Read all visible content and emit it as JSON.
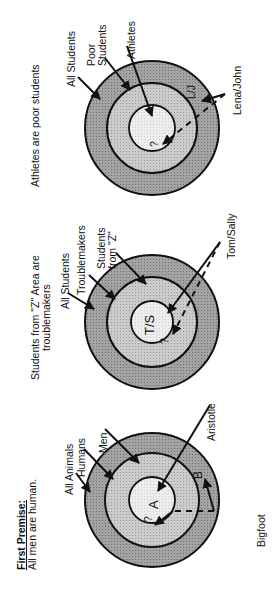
{
  "diagrams": [
    {
      "heading_title": "First Premise:",
      "heading_text": "All men are human.",
      "rings": [
        "All Animals",
        "Humans",
        "Men"
      ],
      "inner_marker": "A",
      "question_mark": "?",
      "outer_marker": "B",
      "pointer_labels": {
        "inner_item": "Aristotle",
        "outside_item": "Bigfoot"
      }
    },
    {
      "heading_text": "Students from \"Z\" Area are troublemakers",
      "heading_line1": "Students from \"Z\" Area are",
      "heading_line2": "troublemakers",
      "rings": [
        "All Students",
        "Troublemakers",
        "Students from \"Z\""
      ],
      "ring3_line1": "Students",
      "ring3_line2": "from \"Z\"",
      "inner_marker": "T/S",
      "question_mark": "?",
      "pointer_labels": {
        "inner_item": "Tom/Sally"
      }
    },
    {
      "heading_text": "Athletes are poor students",
      "rings": [
        "All Students",
        "Poor Students",
        "Athletes"
      ],
      "ring2_line1": "Poor",
      "ring2_line2": "Students",
      "outer_marker": "L/J",
      "question_mark": "?",
      "pointer_labels": {
        "inner_item": "Lena/John"
      }
    }
  ],
  "colors": {
    "outer_ring": "#9a9a9a",
    "middle_ring": "#c4c4c4",
    "inner_ring": "#e8e8e8",
    "stroke": "#111111"
  }
}
